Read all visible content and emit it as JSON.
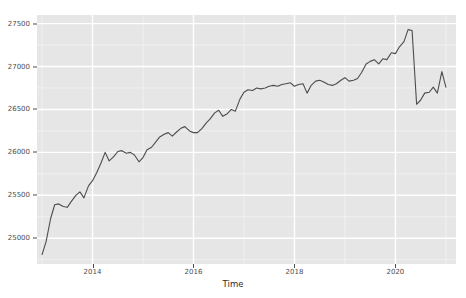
{
  "chart_data": {
    "type": "line",
    "title": "",
    "subtitle": "",
    "xlabel": "Time",
    "ylabel": "",
    "grid": true,
    "legend": false,
    "legend_position": "none",
    "theme": "ggplot2-grey",
    "line_color": "#4d4d4d",
    "panel_background": "#e6e6e6",
    "gridline_major_color": "#ffffff",
    "gridline_minor_color": "#f2f2f2",
    "xlim": [
      2012.9,
      2021.2
    ],
    "ylim": [
      24700,
      27600
    ],
    "x_ticks": [
      2014,
      2016,
      2018,
      2020
    ],
    "x_tick_labels": [
      "2014",
      "2016",
      "2018",
      "2020"
    ],
    "y_ticks": [
      25000,
      25500,
      26000,
      26500,
      27000,
      27500
    ],
    "y_tick_labels": [
      "25000",
      "25500",
      "26000",
      "26500",
      "27000",
      "27500"
    ],
    "series": [
      {
        "name": "series-1",
        "x": [
          2013.0,
          2013.08,
          2013.17,
          2013.25,
          2013.33,
          2013.42,
          2013.5,
          2013.58,
          2013.67,
          2013.75,
          2013.83,
          2013.92,
          2014.0,
          2014.08,
          2014.17,
          2014.25,
          2014.33,
          2014.42,
          2014.5,
          2014.58,
          2014.67,
          2014.75,
          2014.83,
          2014.92,
          2015.0,
          2015.08,
          2015.17,
          2015.25,
          2015.33,
          2015.42,
          2015.5,
          2015.58,
          2015.67,
          2015.75,
          2015.83,
          2015.92,
          2016.0,
          2016.08,
          2016.17,
          2016.25,
          2016.33,
          2016.42,
          2016.5,
          2016.58,
          2016.67,
          2016.75,
          2016.83,
          2016.92,
          2017.0,
          2017.08,
          2017.17,
          2017.25,
          2017.33,
          2017.42,
          2017.5,
          2017.58,
          2017.67,
          2017.75,
          2017.83,
          2017.92,
          2018.0,
          2018.08,
          2018.17,
          2018.25,
          2018.33,
          2018.42,
          2018.5,
          2018.58,
          2018.67,
          2018.75,
          2018.83,
          2018.92,
          2019.0,
          2019.08,
          2019.17,
          2019.25,
          2019.33,
          2019.42,
          2019.5,
          2019.58,
          2019.67,
          2019.75,
          2019.83,
          2019.92,
          2020.0,
          2020.08,
          2020.17,
          2020.25,
          2020.33,
          2020.42,
          2020.5,
          2020.58,
          2020.67,
          2020.75,
          2020.83,
          2020.92,
          2021.0
        ],
        "values": [
          24810,
          24960,
          25230,
          25390,
          25400,
          25370,
          25360,
          25430,
          25500,
          25540,
          25470,
          25610,
          25670,
          25760,
          25880,
          26000,
          25900,
          25950,
          26010,
          26020,
          25990,
          26000,
          25970,
          25890,
          25940,
          26030,
          26060,
          26120,
          26180,
          26210,
          26230,
          26190,
          26240,
          26280,
          26300,
          26250,
          26230,
          26230,
          26280,
          26340,
          26390,
          26460,
          26490,
          26420,
          26450,
          26500,
          26480,
          26620,
          26700,
          26730,
          26720,
          26750,
          26740,
          26750,
          26770,
          26780,
          26770,
          26790,
          26800,
          26810,
          26770,
          26790,
          26800,
          26690,
          26780,
          26830,
          26840,
          26820,
          26790,
          26780,
          26800,
          26840,
          26870,
          26830,
          26840,
          26860,
          26930,
          27030,
          27060,
          27080,
          27030,
          27090,
          27080,
          27160,
          27150,
          27230,
          27290,
          27430,
          27420,
          26560,
          26610,
          26690,
          26700,
          26760,
          26690,
          26940,
          26760
        ]
      }
    ],
    "annotations": [
      {
        "label": "sharp decline in 2020",
        "x": 2020.33,
        "y_from": 27420,
        "y_to": 26560
      }
    ]
  },
  "axes": {
    "x_title": "Time"
  }
}
